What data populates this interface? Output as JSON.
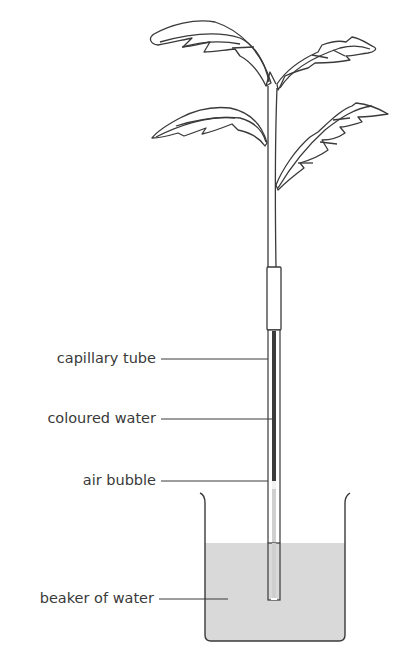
{
  "figure": {
    "type": "potometer-style experimental setup",
    "top_text_fragment": "(cropped caption text, not legible)"
  },
  "labels": [
    {
      "id": "capillary_tube",
      "text": "capillary tube"
    },
    {
      "id": "coloured_water",
      "text": "coloured water"
    },
    {
      "id": "air_bubble",
      "text": "air bubble"
    },
    {
      "id": "beaker_of_water",
      "text": "beaker of water"
    }
  ],
  "components": {
    "plant": {
      "leaves": 4,
      "description": "leafy shoot with serrated leaves"
    },
    "sleeve": "rubber tubing connecting stem to capillary tube",
    "capillary_tube": "narrow glass tube filled with coloured water",
    "air_bubble": "bubble marker inside tube",
    "beaker": "beaker partially filled with water"
  },
  "colors": {
    "line": "#3a3a3a",
    "coloured_water": "#3c3c3c",
    "water": "#d9d9d9",
    "tube_inner": "#cfcfcf"
  }
}
